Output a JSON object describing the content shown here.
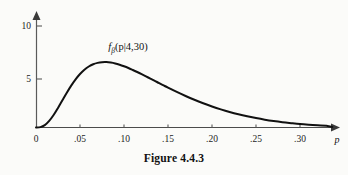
{
  "figure": {
    "caption": "Figure 4.4.3",
    "curve_label_main": "f",
    "curve_label_subscript": "β",
    "curve_label_args": "(p|4,30)",
    "curve_label_full": "fβ(p|4,30)",
    "x_axis_name": "p",
    "background_color": "#fbfbf9",
    "curve_color": "#111111",
    "axis_color": "#4b4b4b"
  },
  "chart_data": {
    "type": "line",
    "title": "Figure 4.4.3",
    "subtitle": "",
    "xlabel": "p",
    "ylabel": "",
    "annotations": [
      {
        "text": "fβ(p|4,30)",
        "x": 0.105,
        "y": 8.1
      }
    ],
    "legend": [],
    "legend_position": "none",
    "grid": false,
    "xlim": [
      0,
      0.335
    ],
    "ylim": [
      0,
      10.6
    ],
    "xticks": [
      0,
      0.05,
      0.1,
      0.15,
      0.2,
      0.25,
      0.3
    ],
    "xticklabels": [
      "0",
      ".05",
      ".10",
      ".15",
      ".20",
      ".25",
      ".30"
    ],
    "yticks": [
      5,
      10
    ],
    "yticklabels": [
      "5",
      "10"
    ],
    "series": [
      {
        "name": "fβ(p|4,30)",
        "x": [
          0.0,
          0.005,
          0.01,
          0.015,
          0.02,
          0.025,
          0.03,
          0.035,
          0.04,
          0.045,
          0.05,
          0.055,
          0.06,
          0.065,
          0.07,
          0.075,
          0.08,
          0.085,
          0.09,
          0.095,
          0.1,
          0.105,
          0.11,
          0.115,
          0.12,
          0.125,
          0.13,
          0.135,
          0.14,
          0.145,
          0.15,
          0.16,
          0.17,
          0.18,
          0.19,
          0.2,
          0.21,
          0.22,
          0.23,
          0.24,
          0.25,
          0.26,
          0.27,
          0.28,
          0.29,
          0.3,
          0.31,
          0.32,
          0.33
        ],
        "y": [
          0.0,
          0.04,
          0.25,
          0.68,
          1.29,
          2.02,
          2.81,
          3.59,
          4.32,
          4.97,
          5.52,
          5.96,
          6.29,
          6.52,
          6.66,
          6.73,
          6.74,
          6.69,
          6.6,
          6.47,
          6.31,
          6.13,
          5.93,
          5.72,
          5.5,
          5.27,
          5.04,
          4.81,
          4.57,
          4.34,
          4.11,
          3.67,
          3.25,
          2.86,
          2.5,
          2.17,
          1.87,
          1.6,
          1.36,
          1.15,
          0.97,
          0.81,
          0.67,
          0.55,
          0.45,
          0.36,
          0.29,
          0.23,
          0.18
        ],
        "peak_x": 0.105,
        "peak_y": 6.8
      }
    ]
  }
}
